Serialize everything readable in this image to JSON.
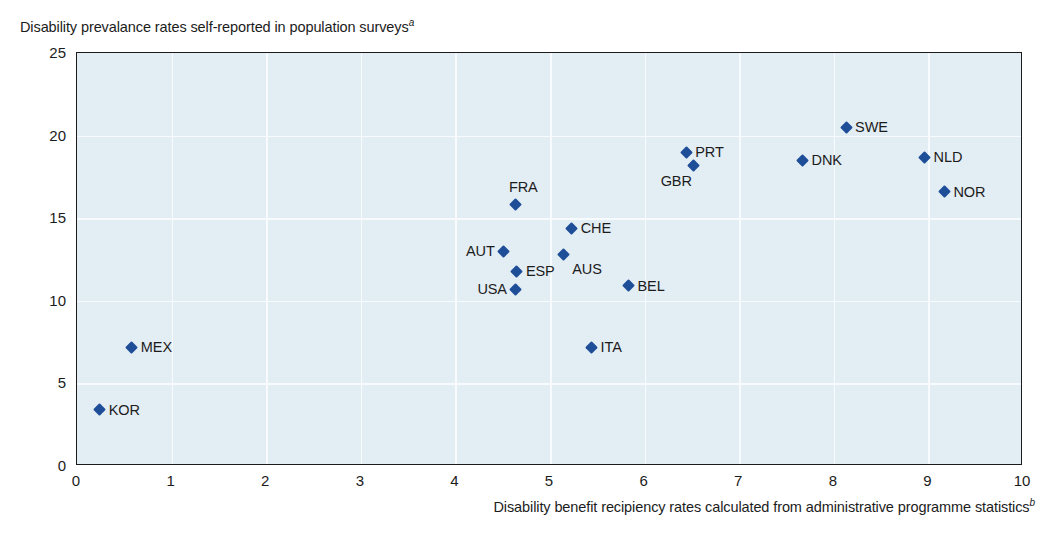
{
  "chart_data": {
    "type": "scatter",
    "title": "Disability prevalance rates self-reported in population surveys",
    "title_footnote": "a",
    "ylabel": "Disability prevalance rates self-reported in population surveys",
    "xlabel": "Disability benefit recipiency rates calculated from administrative programme statistics",
    "xlabel_footnote": "b",
    "xlim": [
      0,
      10
    ],
    "ylim": [
      0,
      25
    ],
    "xticks": [
      0,
      1,
      2,
      3,
      4,
      5,
      6,
      7,
      8,
      9,
      10
    ],
    "yticks": [
      0,
      5,
      10,
      15,
      20,
      25
    ],
    "grid": true,
    "legend": "none",
    "marker_color": "#1f4e99",
    "plot_background": "#e3edf4",
    "gridline_color": "#f8fbfd",
    "points": [
      {
        "label": "KOR",
        "x": 0.24,
        "y": 3.4,
        "label_pos": "right"
      },
      {
        "label": "MEX",
        "x": 0.58,
        "y": 7.2,
        "label_pos": "right"
      },
      {
        "label": "AUT",
        "x": 4.51,
        "y": 13.0,
        "label_pos": "left"
      },
      {
        "label": "ESP",
        "x": 4.65,
        "y": 11.8,
        "label_pos": "right"
      },
      {
        "label": "USA",
        "x": 4.64,
        "y": 10.7,
        "label_pos": "left"
      },
      {
        "label": "FRA",
        "x": 4.64,
        "y": 15.8,
        "label_pos": "above"
      },
      {
        "label": "ITA",
        "x": 5.44,
        "y": 7.2,
        "label_pos": "right"
      },
      {
        "label": "AUS",
        "x": 5.14,
        "y": 12.8,
        "label_pos": "below"
      },
      {
        "label": "CHE",
        "x": 5.23,
        "y": 14.4,
        "label_pos": "right"
      },
      {
        "label": "BEL",
        "x": 5.83,
        "y": 10.9,
        "label_pos": "right"
      },
      {
        "label": "PRT",
        "x": 6.44,
        "y": 19.0,
        "label_pos": "right"
      },
      {
        "label": "GBR",
        "x": 6.52,
        "y": 18.2,
        "label_pos": "belowl"
      },
      {
        "label": "DNK",
        "x": 7.67,
        "y": 18.5,
        "label_pos": "right"
      },
      {
        "label": "SWE",
        "x": 8.13,
        "y": 20.5,
        "label_pos": "right"
      },
      {
        "label": "NLD",
        "x": 8.96,
        "y": 18.7,
        "label_pos": "right"
      },
      {
        "label": "NOR",
        "x": 9.17,
        "y": 16.6,
        "label_pos": "right"
      }
    ]
  }
}
